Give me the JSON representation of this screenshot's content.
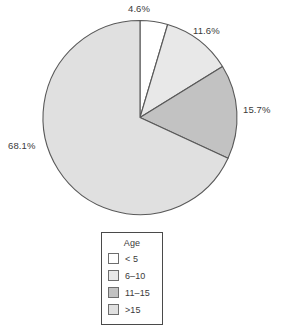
{
  "chart_data": {
    "type": "pie",
    "title": "",
    "legend_title": "Age",
    "legend_position": "bottom-center",
    "start_angle_deg": 0,
    "direction": "clockwise",
    "categories": [
      "< 5",
      "6–10",
      "11–15",
      ">15"
    ],
    "values": [
      4.6,
      11.6,
      15.7,
      68.1
    ],
    "value_unit": "percent",
    "data_labels": [
      "4.6%",
      "11.6%",
      "15.7%",
      "68.1%"
    ],
    "slice_colors": [
      "#ffffff",
      "#e8e8e8",
      "#c2c2c2",
      "#e0e0e0"
    ],
    "slice_edge_color": "#595959",
    "label_color": "#3a3a3a",
    "legend_border_color": "#4a4a4a",
    "background": "#ffffff"
  },
  "labels": {
    "pct_0": "4.6%",
    "pct_1": "11.6%",
    "pct_2": "15.7%",
    "pct_3": "68.1%"
  },
  "legend": {
    "title": "Age",
    "items": [
      {
        "label": "< 5"
      },
      {
        "label": "6–10"
      },
      {
        "label": "11–15"
      },
      {
        "label": ">15"
      }
    ]
  }
}
